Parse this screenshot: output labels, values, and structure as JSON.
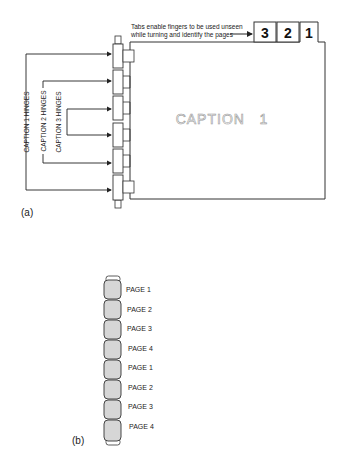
{
  "figure_a": {
    "label": "(a)",
    "callout": {
      "line1": "Tabs enable fingers to be used unseen",
      "line2": "while turning and identify the pages"
    },
    "tabs": [
      "3",
      "2",
      "1"
    ],
    "page_caption": "CAPTION   1",
    "hinge_labels": {
      "caption1": "CAPTION 1 HINGES",
      "caption2": "CAPTION 2 HINGES",
      "caption3": "CAPTION 3 HINGES"
    }
  },
  "figure_b": {
    "label": "(b)",
    "pages": [
      "PAGE 1",
      "PAGE 2",
      "PAGE 3",
      "PAGE 4",
      "PAGE 1",
      "PAGE 2",
      "PAGE 3",
      "PAGE 4"
    ]
  },
  "colors": {
    "line": "#222222",
    "hinge_fill": "#d6d6d6",
    "caption_outline": "#9a9a9a"
  }
}
